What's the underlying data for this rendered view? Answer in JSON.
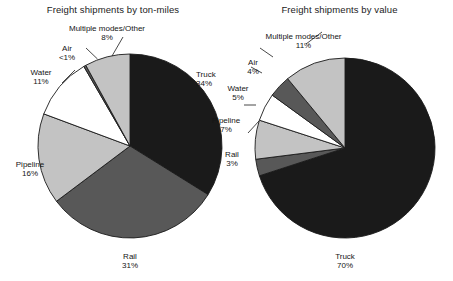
{
  "figure": {
    "background": "#ffffff",
    "text_color": "#151515"
  },
  "palette": {
    "truck": "#1a1a1a",
    "rail": "#585858",
    "pipeline": "#c3c3c3",
    "water": "#ffffff",
    "air": "#585858",
    "other": "#c3c3c3",
    "outline": "#1b1b1b"
  },
  "charts": [
    {
      "id": "ton-miles",
      "title": "Freight shipments by ton-miles",
      "labels": {
        "truck": {
          "name": "Truck",
          "value": "34%"
        },
        "rail": {
          "name": "Rail",
          "value": "31%"
        },
        "pipeline": {
          "name": "Pipeline",
          "value": "16%"
        },
        "water": {
          "name": "Water",
          "value": "11%"
        },
        "air": {
          "name": "Air",
          "value": "<1%"
        },
        "other": {
          "name": "Multiple modes/Other",
          "value": "8%"
        }
      }
    },
    {
      "id": "value",
      "title": "Freight shipments by value",
      "labels": {
        "truck": {
          "name": "Truck",
          "value": "70%"
        },
        "rail": {
          "name": "Rail",
          "value": "3%"
        },
        "pipeline": {
          "name": "Pipeline",
          "value": "7%"
        },
        "water": {
          "name": "Water",
          "value": "5%"
        },
        "air": {
          "name": "Air",
          "value": "4%"
        },
        "other": {
          "name": "Multiple modes/Other",
          "value": "11%"
        }
      }
    }
  ],
  "chart_data": [
    {
      "type": "pie",
      "title": "Freight shipments by ton-miles",
      "xlabel": "",
      "ylabel": "",
      "legend": "none",
      "start_angle_deg": 90,
      "direction": "clockwise",
      "categories": [
        "Truck",
        "Rail",
        "Pipeline",
        "Water",
        "Air",
        "Multiple modes/Other"
      ],
      "values": [
        34,
        31,
        16,
        11,
        0.4,
        8
      ],
      "value_labels": [
        "34%",
        "31%",
        "16%",
        "11%",
        "<1%",
        "8%"
      ],
      "colors": [
        "#1a1a1a",
        "#585858",
        "#c3c3c3",
        "#ffffff",
        "#585858",
        "#c3c3c3"
      ],
      "units": "percent of total ton-miles"
    },
    {
      "type": "pie",
      "title": "Freight shipments by value",
      "xlabel": "",
      "ylabel": "",
      "legend": "none",
      "start_angle_deg": 90,
      "direction": "clockwise",
      "categories": [
        "Truck",
        "Rail",
        "Pipeline",
        "Water",
        "Air",
        "Multiple modes/Other"
      ],
      "values": [
        70,
        3,
        7,
        5,
        4,
        11
      ],
      "value_labels": [
        "70%",
        "3%",
        "7%",
        "5%",
        "4%",
        "11%"
      ],
      "colors": [
        "#1a1a1a",
        "#585858",
        "#c3c3c3",
        "#ffffff",
        "#585858",
        "#c3c3c3"
      ],
      "units": "percent of total value"
    }
  ]
}
